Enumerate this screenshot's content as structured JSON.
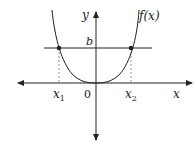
{
  "diagram": {
    "function_label": "f(x)",
    "y_axis_label": "y",
    "x_axis_label": "x",
    "origin_label": "0",
    "level_label": "b",
    "x1_label": "x",
    "x1_sub": "1",
    "x2_label": "x",
    "x2_sub": "2",
    "colors": {
      "stroke": "#222222",
      "dashed": "#777777",
      "background": "#ffffff"
    }
  }
}
